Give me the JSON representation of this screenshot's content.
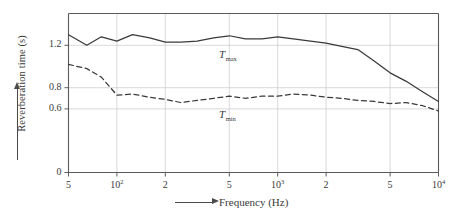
{
  "chart_data": {
    "type": "line",
    "title": "",
    "xlabel": "Frequency (Hz)",
    "ylabel": "Reverberation time (s)",
    "xscale": "log",
    "xlim": [
      50,
      10000
    ],
    "ylim": [
      0,
      1.5
    ],
    "grid": true,
    "legend_position": "inline-annotation",
    "y_ticks": [
      {
        "value": 0,
        "label": "0"
      },
      {
        "value": 0.6,
        "label": "0.6"
      },
      {
        "value": 0.8,
        "label": "0.8"
      },
      {
        "value": 1.2,
        "label": "1.2"
      }
    ],
    "x_ticks": [
      {
        "value": 50,
        "label": "5",
        "sup": ""
      },
      {
        "value": 100,
        "label": "10",
        "sup": "2"
      },
      {
        "value": 200,
        "label": "2",
        "sup": ""
      },
      {
        "value": 500,
        "label": "5",
        "sup": ""
      },
      {
        "value": 1000,
        "label": "10",
        "sup": "3"
      },
      {
        "value": 2000,
        "label": "2",
        "sup": ""
      },
      {
        "value": 5000,
        "label": "5",
        "sup": ""
      },
      {
        "value": 10000,
        "label": "10",
        "sup": "4"
      }
    ],
    "series": [
      {
        "name": "T_max",
        "annotation": "T",
        "annotation_sub": "max",
        "style": "solid",
        "color": "#3a3a3a",
        "x": [
          50,
          65,
          80,
          100,
          125,
          160,
          200,
          250,
          315,
          400,
          500,
          630,
          800,
          1000,
          1250,
          1600,
          2000,
          2500,
          3150,
          4000,
          5000,
          6300,
          8000,
          10000
        ],
        "y": [
          1.3,
          1.2,
          1.28,
          1.24,
          1.3,
          1.27,
          1.23,
          1.23,
          1.24,
          1.27,
          1.29,
          1.26,
          1.26,
          1.28,
          1.26,
          1.24,
          1.22,
          1.19,
          1.16,
          1.05,
          0.94,
          0.86,
          0.76,
          0.67
        ]
      },
      {
        "name": "T_min",
        "annotation": "T",
        "annotation_sub": "min",
        "style": "dashed",
        "color": "#3a3a3a",
        "x": [
          50,
          65,
          80,
          100,
          125,
          160,
          200,
          250,
          315,
          400,
          500,
          630,
          800,
          1000,
          1250,
          1600,
          2000,
          2500,
          3150,
          4000,
          5000,
          6300,
          8000,
          10000
        ],
        "y": [
          1.02,
          0.98,
          0.9,
          0.73,
          0.74,
          0.71,
          0.69,
          0.66,
          0.68,
          0.7,
          0.72,
          0.7,
          0.72,
          0.72,
          0.74,
          0.73,
          0.71,
          0.7,
          0.68,
          0.67,
          0.65,
          0.66,
          0.63,
          0.58
        ]
      }
    ]
  },
  "axis_arrow_labels": {
    "x_arrow": "arrow-right",
    "y_arrow": "arrow-up"
  }
}
